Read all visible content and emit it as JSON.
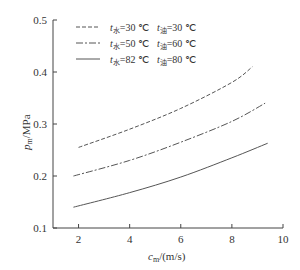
{
  "chart_data": {
    "type": "line",
    "title": "",
    "xlabel": "c_m/(m/s)",
    "ylabel": "p_m/MPa",
    "xlim": [
      1,
      10
    ],
    "ylim": [
      0.1,
      0.5
    ],
    "xticks": [
      "2",
      "4",
      "6",
      "8",
      "10"
    ],
    "yticks": [
      "0.1",
      "0.2",
      "0.3",
      "0.4",
      "0.5"
    ],
    "grid": false,
    "legend_position": "upper-left",
    "series": [
      {
        "name": "t水=30 ℃  t油=30 ℃",
        "style": "dashed",
        "x": [
          2.0,
          4.0,
          6.0,
          8.0,
          8.8
        ],
        "y": [
          0.255,
          0.29,
          0.33,
          0.38,
          0.41
        ]
      },
      {
        "name": "t水=50 ℃  t油=60 ℃",
        "style": "dash-dot",
        "x": [
          1.8,
          4.0,
          6.0,
          8.0,
          9.3
        ],
        "y": [
          0.2,
          0.23,
          0.265,
          0.305,
          0.34
        ]
      },
      {
        "name": "t水=82 ℃  t油=80 ℃",
        "style": "solid",
        "x": [
          1.8,
          4.0,
          6.0,
          8.0,
          9.4
        ],
        "y": [
          0.14,
          0.168,
          0.198,
          0.235,
          0.263
        ]
      }
    ]
  },
  "labels": {
    "ylabel_main": "p",
    "ylabel_sub": "m",
    "ylabel_unit": "/MPa",
    "xlabel_main": "c",
    "xlabel_sub": "m",
    "xlabel_unit": "/(m/s)"
  },
  "legend": [
    {
      "t1": "t",
      "s1": "水",
      "v1": "=30 ℃",
      "t2": "t",
      "s2": "油",
      "v2": "=30 ℃"
    },
    {
      "t1": "t",
      "s1": "水",
      "v1": "=50 ℃",
      "t2": "t",
      "s2": "油",
      "v2": "=60 ℃"
    },
    {
      "t1": "t",
      "s1": "水",
      "v1": "=82 ℃",
      "t2": "t",
      "s2": "油",
      "v2": "=80 ℃"
    }
  ]
}
